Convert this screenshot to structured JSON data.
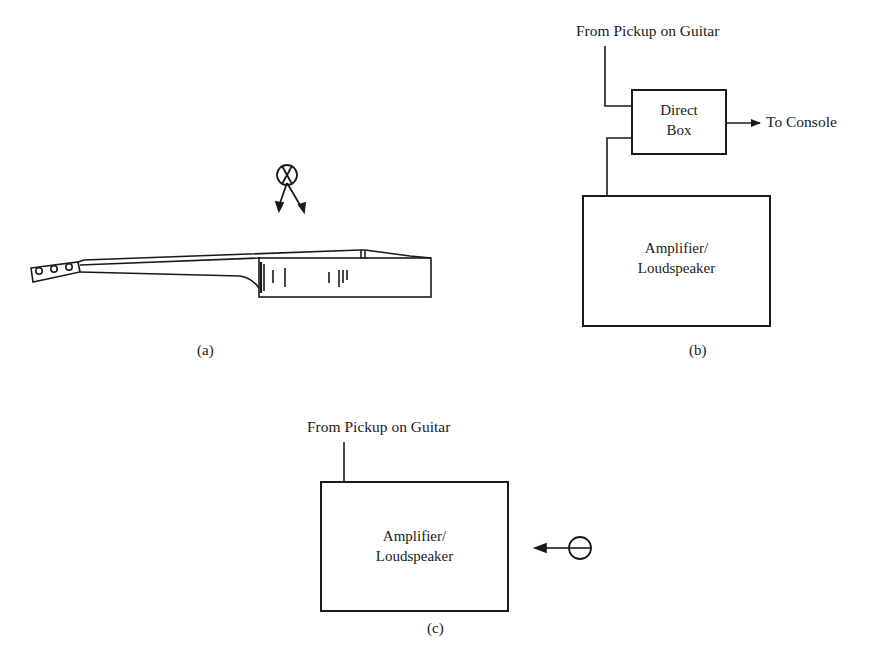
{
  "figure": {
    "panel_a": {
      "caption": "(a)",
      "elements": [
        "guitar-side-view",
        "microphone-figure-eight"
      ]
    },
    "panel_b": {
      "caption": "(b)",
      "input_label": "From Pickup on Guitar",
      "direct_box": {
        "line1": "Direct",
        "line2": "Box"
      },
      "output_label": "To Console",
      "amp_box": {
        "line1": "Amplifier/",
        "line2": "Loudspeaker"
      }
    },
    "panel_c": {
      "caption": "(c)",
      "input_label": "From Pickup on Guitar",
      "amp_box": {
        "line1": "Amplifier/",
        "line2": "Loudspeaker"
      },
      "elements": [
        "microphone-cardioid"
      ]
    }
  },
  "colors": {
    "ink": "#1a1a1a",
    "background": "#ffffff"
  }
}
